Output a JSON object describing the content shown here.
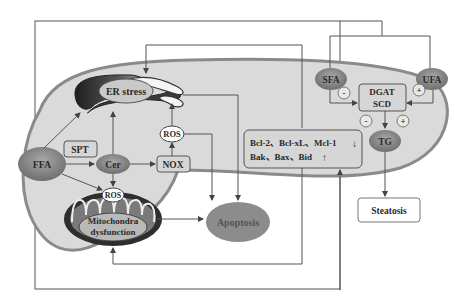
{
  "diagram": {
    "nodes": {
      "er_stress": "ER stress",
      "ros_top": "ROS",
      "spt": "SPT",
      "ffa": "FFA",
      "cer": "Cer",
      "nox": "NOX",
      "ros_mito": "ROS",
      "mito_line1": "Mitochondra",
      "mito_line2": "dysfunction",
      "apoptosis": "Apoptosis",
      "bcl_line1": "Bcl-2、Bcl-xL、Mcl-1",
      "bcl_arrow1": "↓",
      "bcl_line2": "Bak、Bax、Bid",
      "bcl_arrow2": "↑",
      "sfa": "SFA",
      "ufa": "UFA",
      "dgat": "DGAT",
      "scd": "SCD",
      "tg": "TG",
      "steatosis": "Steatosis"
    },
    "signs": {
      "sfa_sign": "-",
      "ufa_sign": "+",
      "tg_minus": "-",
      "tg_plus": "+"
    },
    "colors": {
      "cell_fill": "#d9d9d9",
      "cell_border": "#8a8a8a",
      "node_oval": "#8c8c8c",
      "node_box": "#d6d6d6",
      "organelle_dark": "#333333",
      "lines": "#555555"
    }
  }
}
